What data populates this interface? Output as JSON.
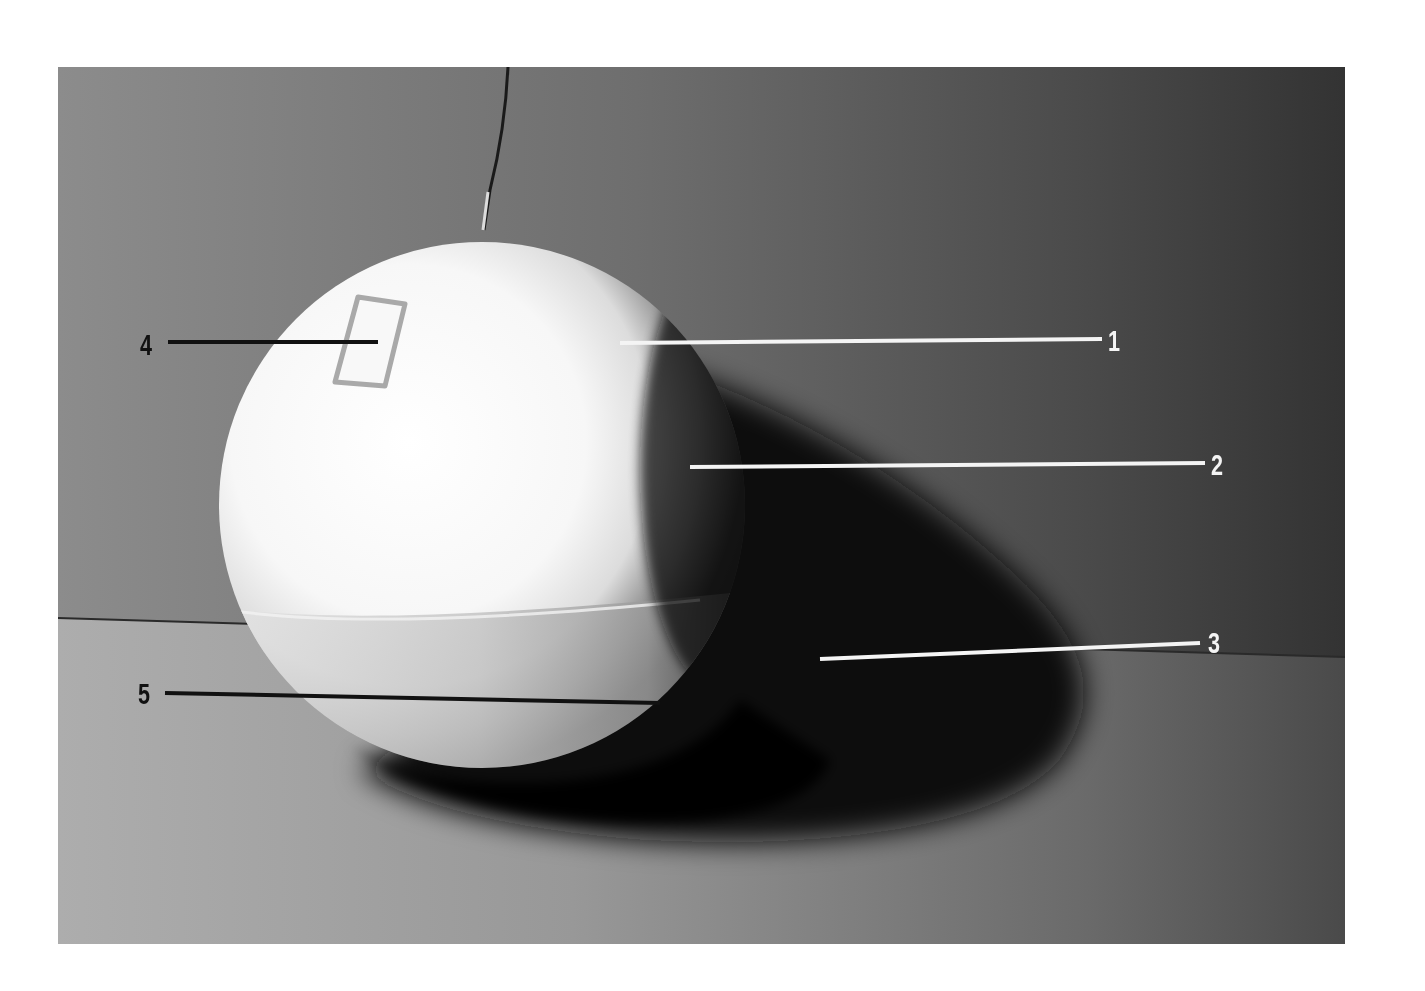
{
  "figure": {
    "colors": {
      "page_background": "#ffffff",
      "wall_light": "#8a8a8a",
      "wall_dark": "#3a3a3a",
      "floor_light": "#a8a8a8",
      "floor_dark": "#4a4a4a",
      "sphere_highlight": "#ffffff",
      "shadow": "#0a0a0a",
      "callout_dark": "#111111",
      "callout_light": "#f4f4f4"
    },
    "callouts": [
      {
        "number": "1",
        "color": "light"
      },
      {
        "number": "2",
        "color": "light"
      },
      {
        "number": "3",
        "color": "light"
      },
      {
        "number": "4",
        "color": "dark"
      },
      {
        "number": "5",
        "color": "dark"
      }
    ]
  }
}
